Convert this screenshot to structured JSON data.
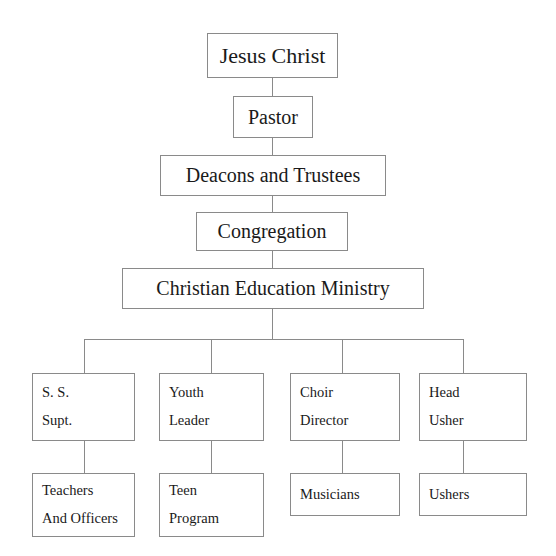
{
  "chart": {
    "type": "org-chart",
    "line_color": "#8a8a8a",
    "background_color": "#ffffff",
    "text_color": "#1a1a1a",
    "nodes": {
      "jesus_christ": {
        "label": "Jesus Christ"
      },
      "pastor": {
        "label": "Pastor"
      },
      "deacons_and_trustees": {
        "label": "Deacons and Trustees"
      },
      "congregation": {
        "label": "Congregation"
      },
      "christian_education_ministry": {
        "label": "Christian Education Ministry"
      },
      "ss_supt": {
        "line1": "S. S.",
        "line2": "Supt."
      },
      "youth_leader": {
        "line1": "Youth",
        "line2": "Leader"
      },
      "choir_director": {
        "line1": "Choir",
        "line2": "Director"
      },
      "head_usher": {
        "line1": "Head",
        "line2": "Usher"
      },
      "teachers_and_officers": {
        "line1": "Teachers",
        "line2": "And Officers"
      },
      "teen_program": {
        "line1": "Teen",
        "line2": "Program"
      },
      "musicians": {
        "label": "Musicians"
      },
      "ushers": {
        "label": "Ushers"
      }
    }
  }
}
